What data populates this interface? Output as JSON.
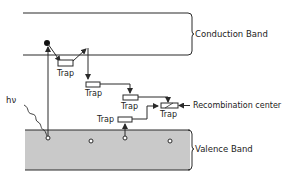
{
  "diagram": {
    "conduction_band_label": "Conduction Band",
    "valence_band_label": "Valence Band",
    "photon_label": "hν",
    "recombination_label": "Recombination center",
    "traps": [
      {
        "label": "Trap"
      },
      {
        "label": "Trap"
      },
      {
        "label": "Trap"
      },
      {
        "label": "Trap"
      },
      {
        "label": "Trap"
      }
    ],
    "colors": {
      "line": "#2a2a2a",
      "valence_fill": "#c9c9c9",
      "background": "#ffffff"
    }
  }
}
